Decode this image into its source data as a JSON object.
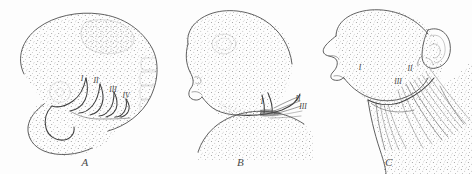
{
  "figure": {
    "background_color": "#fdfdfd",
    "ink_color": "#4d4d4d",
    "stipple_color": "#8a8a8a"
  },
  "panels": [
    {
      "letter": "A",
      "name": "panel-a",
      "description": "Early embryo head showing four pharyngeal arches and somites",
      "labels": [
        {
          "text": "I",
          "x": 82,
          "y": 81
        },
        {
          "text": "II",
          "x": 96,
          "y": 83
        },
        {
          "text": "III",
          "x": 113,
          "y": 90
        },
        {
          "text": "IV",
          "x": 126,
          "y": 96
        }
      ]
    },
    {
      "letter": "B",
      "name": "panel-b",
      "description": "Intermediate stage fetal head in profile with receding arches",
      "labels": [
        {
          "text": "I",
          "x": 262,
          "y": 101
        },
        {
          "text": "II",
          "x": 298,
          "y": 99
        },
        {
          "text": "III",
          "x": 303,
          "y": 107
        }
      ]
    },
    {
      "letter": "C",
      "name": "panel-c",
      "description": "Late stage head and neck with external ear and platysma fibres",
      "labels": [
        {
          "text": "I",
          "x": 360,
          "y": 68
        },
        {
          "text": "II",
          "x": 409,
          "y": 69
        },
        {
          "text": "III",
          "x": 398,
          "y": 81
        }
      ]
    }
  ]
}
